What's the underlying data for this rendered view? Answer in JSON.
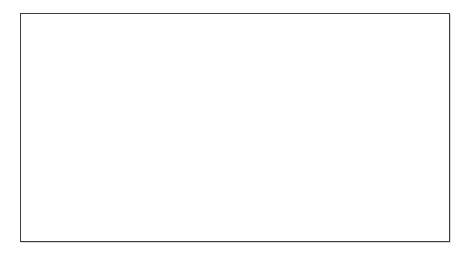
{
  "figure": {
    "kind": "soil-erosion-process-diagram",
    "background_color": "#ffffff",
    "frame_border_color": "#3c3c3c"
  },
  "palette": {
    "subsoil": "#5a5a5a",
    "subsoil_dark": "#4e4e4e",
    "topsoil": "#8e8e8e",
    "topsoil_light": "#9a9a9a",
    "raindrop": "#c9c9c9",
    "raindrop_edge": "#b0b0b0",
    "particle": "#8a8a8a",
    "particle_dark": "#5f5f5f",
    "splash": "#a6a6a6",
    "arrow": "#1a1a1a",
    "text": "#121212"
  },
  "labels": [
    {
      "id": "rainfall",
      "text": "Rainfall",
      "x": 155,
      "y": 47
    },
    {
      "id": "detachment",
      "text": "Detachment",
      "x": 196,
      "y": 109
    },
    {
      "id": "transportation",
      "text": "Transportation",
      "x": 240,
      "y": 144
    },
    {
      "id": "translocation",
      "text": "Translocation",
      "x": 303,
      "y": 169
    },
    {
      "id": "deposition",
      "text": "Deposition",
      "x": 383,
      "y": 199
    }
  ],
  "slope": {
    "description": "concave hillslope descending left to right",
    "subsoil_path": "M0,47 C34,52 74,70 112,98 C152,128 196,156 244,176 C296,198 356,212 430,218 L430,229 L0,229 Z",
    "topsoil_path": "M0,47 C34,52 74,70 112,98 C152,128 196,156 244,176 C296,198 356,212 430,218 L430,226 C356,220 296,206 244,184 C196,164 152,136 112,106 C74,78 34,60 0,55 Z"
  },
  "raindrops": [
    {
      "x": 98,
      "y": 22,
      "s": 1.0
    },
    {
      "x": 118,
      "y": 37,
      "s": 0.92
    },
    {
      "x": 92,
      "y": 52,
      "s": 0.96
    },
    {
      "x": 116,
      "y": 58,
      "s": 0.88
    },
    {
      "x": 145,
      "y": 45,
      "s": 0.94
    },
    {
      "x": 162,
      "y": 18,
      "s": 0.9
    },
    {
      "x": 158,
      "y": 72,
      "s": 0.92
    },
    {
      "x": 98,
      "y": 82,
      "s": 0.95
    },
    {
      "x": 125,
      "y": 92,
      "s": 0.9
    },
    {
      "x": 186,
      "y": 60,
      "s": 0.86
    },
    {
      "x": 166,
      "y": 96,
      "s": 0.88
    },
    {
      "x": 140,
      "y": 112,
      "s": 0.92
    }
  ],
  "splash": {
    "origin_x": 148,
    "origin_y": 152,
    "curved_arrows": [
      {
        "d": "M149,150 C143,142 138,134 134,126",
        "tip": "up-left"
      },
      {
        "d": "M152,150 C156,141 160,134 164,127",
        "tip": "up-right"
      }
    ]
  },
  "flow_arrows": [
    {
      "id": "arrow-transportation",
      "x1": 208,
      "y1": 160,
      "x2": 247,
      "y2": 182
    },
    {
      "id": "arrow-translocation",
      "x1": 262,
      "y1": 183,
      "x2": 302,
      "y2": 203
    },
    {
      "id": "arrow-deposition",
      "x1": 325,
      "y1": 200,
      "x2": 365,
      "y2": 215
    }
  ],
  "particles": [
    {
      "x": 132,
      "y": 130,
      "w": 3,
      "h": 3,
      "r": -18
    },
    {
      "x": 124,
      "y": 144,
      "w": 5,
      "h": 4,
      "r": 12
    },
    {
      "x": 139,
      "y": 139,
      "w": 4,
      "h": 3,
      "r": 30
    },
    {
      "x": 161,
      "y": 135,
      "w": 6,
      "h": 4,
      "r": -25
    },
    {
      "x": 174,
      "y": 142,
      "w": 7,
      "h": 4.5,
      "r": -18
    },
    {
      "x": 186,
      "y": 134,
      "w": 5,
      "h": 3.5,
      "r": 20
    },
    {
      "x": 166,
      "y": 155,
      "w": 6,
      "h": 4,
      "r": -30
    },
    {
      "x": 180,
      "y": 160,
      "w": 5,
      "h": 3.5,
      "r": 15
    },
    {
      "x": 196,
      "y": 152,
      "w": 6.5,
      "h": 4,
      "r": -22
    },
    {
      "x": 152,
      "y": 167,
      "w": 4,
      "h": 3,
      "r": 0
    },
    {
      "x": 206,
      "y": 168,
      "w": 5,
      "h": 4,
      "r": 18
    },
    {
      "x": 219,
      "y": 160,
      "w": 4,
      "h": 3,
      "r": -12
    },
    {
      "x": 232,
      "y": 176,
      "w": 6,
      "h": 4.5,
      "r": -20
    },
    {
      "x": 246,
      "y": 170,
      "w": 4.5,
      "h": 3.5,
      "r": 25
    },
    {
      "x": 258,
      "y": 184,
      "w": 6,
      "h": 4,
      "r": -15
    },
    {
      "x": 272,
      "y": 178,
      "w": 5,
      "h": 3.5,
      "r": 20
    },
    {
      "x": 286,
      "y": 192,
      "w": 6.5,
      "h": 4,
      "r": -18
    },
    {
      "x": 300,
      "y": 186,
      "w": 5,
      "h": 3.5,
      "r": 14
    },
    {
      "x": 316,
      "y": 198,
      "w": 6,
      "h": 4,
      "r": -20
    },
    {
      "x": 330,
      "y": 193,
      "w": 5,
      "h": 3.5,
      "r": 18
    },
    {
      "x": 344,
      "y": 205,
      "w": 6,
      "h": 4,
      "r": -14
    },
    {
      "x": 358,
      "y": 200,
      "w": 4.5,
      "h": 3.5,
      "r": 22
    },
    {
      "x": 372,
      "y": 210,
      "w": 5.5,
      "h": 4,
      "r": -16
    },
    {
      "x": 388,
      "y": 206,
      "w": 5,
      "h": 3.5,
      "r": 16
    },
    {
      "x": 402,
      "y": 213,
      "w": 5,
      "h": 3.5,
      "r": -12
    },
    {
      "x": 416,
      "y": 210,
      "w": 4.5,
      "h": 3,
      "r": 18
    }
  ],
  "speckles": [
    {
      "x": 120,
      "y": 122
    },
    {
      "x": 144,
      "y": 120
    },
    {
      "x": 158,
      "y": 127
    },
    {
      "x": 172,
      "y": 124
    },
    {
      "x": 190,
      "y": 130
    },
    {
      "x": 200,
      "y": 143
    },
    {
      "x": 214,
      "y": 150
    },
    {
      "x": 226,
      "y": 158
    },
    {
      "x": 238,
      "y": 163
    },
    {
      "x": 252,
      "y": 172
    },
    {
      "x": 266,
      "y": 176
    },
    {
      "x": 280,
      "y": 182
    },
    {
      "x": 294,
      "y": 188
    },
    {
      "x": 308,
      "y": 192
    },
    {
      "x": 322,
      "y": 196
    },
    {
      "x": 336,
      "y": 200
    },
    {
      "x": 350,
      "y": 204
    },
    {
      "x": 364,
      "y": 207
    },
    {
      "x": 378,
      "y": 211
    },
    {
      "x": 394,
      "y": 213
    },
    {
      "x": 408,
      "y": 215
    },
    {
      "x": 422,
      "y": 216
    },
    {
      "x": 134,
      "y": 113
    },
    {
      "x": 180,
      "y": 117
    }
  ]
}
